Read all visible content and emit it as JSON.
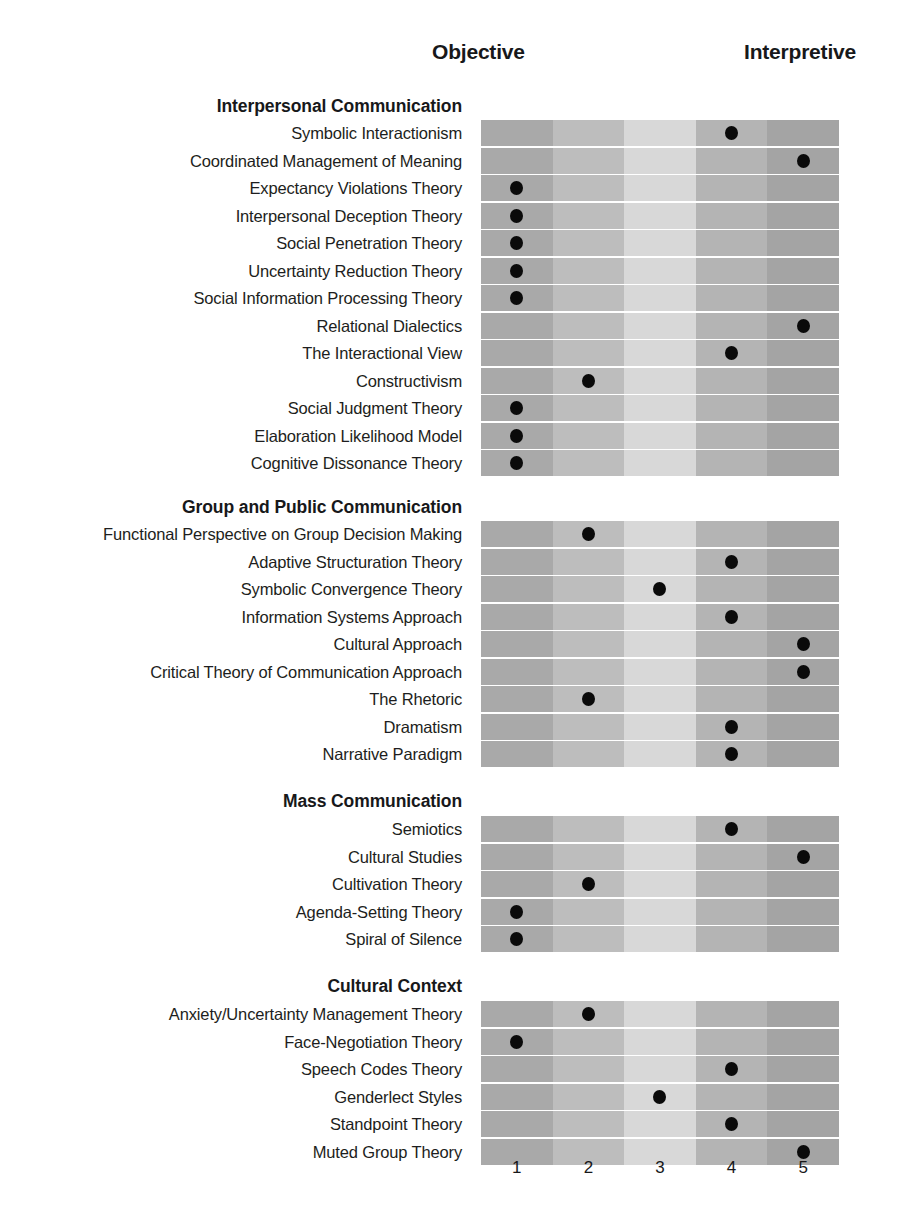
{
  "axis": {
    "left_label": "Objective",
    "right_label": "Interpretive",
    "ticks": [
      "1",
      "2",
      "3",
      "4",
      "5"
    ]
  },
  "colors": {
    "column_1": "#a9a9a9",
    "column_2": "#bdbdbd",
    "column_3": "#d8d8d8",
    "column_4": "#b4b4b4",
    "column_5": "#a4a4a4",
    "dot": "#0a0a0a",
    "text": "#17181a",
    "background": "#ffffff"
  },
  "chart_data": {
    "type": "scatter",
    "title": "",
    "xlabel": "",
    "ylabel": "",
    "x": [
      1,
      2,
      3,
      4,
      5
    ],
    "xlim": [
      1,
      5
    ],
    "grid": true,
    "legend": "none",
    "annotations": [
      "Objective",
      "Interpretive"
    ],
    "tick_labels": [
      "1",
      "2",
      "3",
      "4",
      "5"
    ],
    "sections": [
      {
        "title": "Interpersonal Communication",
        "rows": [
          {
            "label": "Symbolic Interactionism",
            "value": 4
          },
          {
            "label": "Coordinated Management of Meaning",
            "value": 5
          },
          {
            "label": "Expectancy Violations Theory",
            "value": 1
          },
          {
            "label": "Interpersonal Deception Theory",
            "value": 1
          },
          {
            "label": "Social Penetration Theory",
            "value": 1
          },
          {
            "label": "Uncertainty Reduction Theory",
            "value": 1
          },
          {
            "label": "Social Information Processing Theory",
            "value": 1
          },
          {
            "label": "Relational Dialectics",
            "value": 5
          },
          {
            "label": "The Interactional View",
            "value": 4
          },
          {
            "label": "Constructivism",
            "value": 2
          },
          {
            "label": "Social Judgment Theory",
            "value": 1
          },
          {
            "label": "Elaboration Likelihood Model",
            "value": 1
          },
          {
            "label": "Cognitive Dissonance Theory",
            "value": 1
          }
        ]
      },
      {
        "title": "Group and Public Communication",
        "rows": [
          {
            "label": "Functional Perspective on Group Decision Making",
            "value": 2
          },
          {
            "label": "Adaptive Structuration Theory",
            "value": 4
          },
          {
            "label": "Symbolic Convergence Theory",
            "value": 3
          },
          {
            "label": "Information Systems Approach",
            "value": 4
          },
          {
            "label": "Cultural Approach",
            "value": 5
          },
          {
            "label": "Critical Theory of Communication Approach",
            "value": 5
          },
          {
            "label": "The Rhetoric",
            "value": 2
          },
          {
            "label": "Dramatism",
            "value": 4
          },
          {
            "label": "Narrative Paradigm",
            "value": 4
          }
        ]
      },
      {
        "title": "Mass Communication",
        "rows": [
          {
            "label": "Semiotics",
            "value": 4
          },
          {
            "label": "Cultural Studies",
            "value": 5
          },
          {
            "label": "Cultivation Theory",
            "value": 2
          },
          {
            "label": "Agenda-Setting Theory",
            "value": 1
          },
          {
            "label": "Spiral of Silence",
            "value": 1
          }
        ]
      },
      {
        "title": "Cultural Context",
        "rows": [
          {
            "label": "Anxiety/Uncertainty Management Theory",
            "value": 2
          },
          {
            "label": "Face-Negotiation Theory",
            "value": 1
          },
          {
            "label": "Speech Codes Theory",
            "value": 4
          },
          {
            "label": "Genderlect Styles",
            "value": 3
          },
          {
            "label": "Standpoint Theory",
            "value": 4
          },
          {
            "label": "Muted Group Theory",
            "value": 5
          }
        ]
      }
    ]
  }
}
